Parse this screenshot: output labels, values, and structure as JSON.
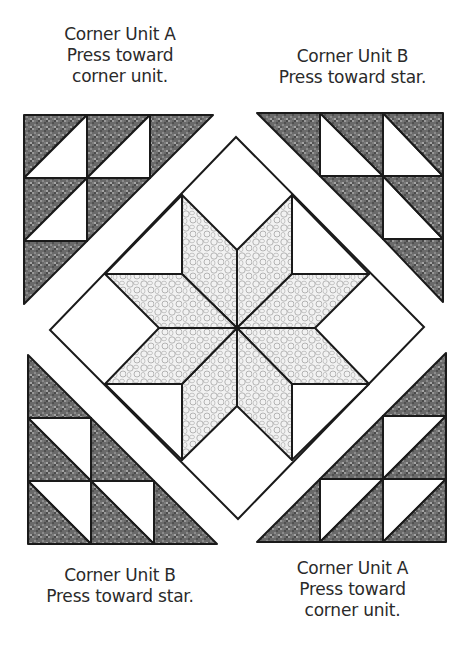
{
  "labels": {
    "top_left": {
      "title": "Corner Unit A",
      "line2": "Press toward",
      "line3": "corner unit."
    },
    "top_right": {
      "title": "Corner Unit B",
      "line2": "Press toward star."
    },
    "bottom_left": {
      "title": "Corner Unit B",
      "line2": "Press toward star."
    },
    "bottom_right": {
      "title": "Corner Unit A",
      "line2": "Press toward",
      "line3": "corner unit."
    }
  },
  "colors": {
    "outline": "#1a1a1a",
    "dark_fabric": "#6e6e6e",
    "star_fabric": "#e9e9e9",
    "background": "#ffffff"
  },
  "block": {
    "name": "LeMoyne Star block with half-square-triangle corner units",
    "star_points": 8,
    "corner_units": [
      "Corner Unit A (top-left)",
      "Corner Unit B (top-right)",
      "Corner Unit B (bottom-left)",
      "Corner Unit A (bottom-right)"
    ]
  }
}
